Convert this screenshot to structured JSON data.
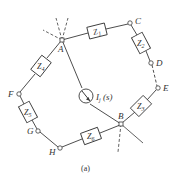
{
  "figure": {
    "caption": "(a)",
    "colors": {
      "line": "#3a3a3a",
      "background": "#ffffff"
    }
  },
  "nodes": {
    "A": {
      "label": "A",
      "x": 62,
      "y": 40,
      "shape": "junction"
    },
    "B": {
      "label": "B",
      "x": 121,
      "y": 124,
      "shape": "junction"
    },
    "C": {
      "label": "C",
      "x": 130,
      "y": 23,
      "shape": "circle"
    },
    "D": {
      "label": "D",
      "x": 151,
      "y": 63,
      "shape": "circle"
    },
    "E": {
      "label": "E",
      "x": 158,
      "y": 88,
      "shape": "circle"
    },
    "F": {
      "label": "F",
      "x": 19,
      "y": 94,
      "shape": "circle"
    },
    "G": {
      "label": "G",
      "x": 38,
      "y": 131,
      "shape": "circle"
    },
    "H": {
      "label": "H",
      "x": 60,
      "y": 148,
      "shape": "circle"
    }
  },
  "impedances": [
    {
      "id": "Z1",
      "label": "Z",
      "sub": "1",
      "x": 97,
      "y": 31,
      "angle": -14
    },
    {
      "id": "Z2",
      "label": "Z",
      "sub": "2",
      "x": 141,
      "y": 43,
      "angle": 62
    },
    {
      "id": "Z3",
      "label": "Z",
      "sub": "3",
      "x": 141,
      "y": 106,
      "angle": -45
    },
    {
      "id": "Z4",
      "label": "Z",
      "sub": "4",
      "x": 41,
      "y": 66,
      "angle": -52
    },
    {
      "id": "Z5",
      "label": "Z",
      "sub": "5",
      "x": 28,
      "y": 112,
      "angle": 62
    },
    {
      "id": "Z6",
      "label": "Z",
      "sub": "6",
      "x": 91,
      "y": 136,
      "angle": -20
    }
  ],
  "source": {
    "id": "Ij",
    "label": "I",
    "sub": "j",
    "arg": " (s)",
    "x": 86,
    "y": 96
  },
  "wires_dashed": [
    "D-E"
  ],
  "ellipsis_branches": {
    "A": 3,
    "B": 3
  }
}
